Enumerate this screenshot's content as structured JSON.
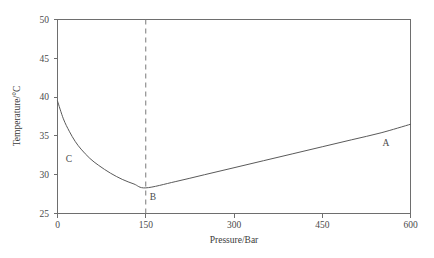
{
  "chart_data": {
    "type": "line",
    "title": "",
    "xlabel": "Pressure/Bar",
    "ylabel": "Temperature/°C",
    "xlim": [
      0,
      600
    ],
    "ylim": [
      25,
      50
    ],
    "xticks": [
      0,
      150,
      300,
      450,
      600
    ],
    "xtick_labels": [
      "0",
      "150",
      "300",
      "450",
      "600"
    ],
    "yticks": [
      25,
      30,
      35,
      40,
      45,
      50
    ],
    "ytick_labels": [
      "25",
      "30",
      "35",
      "40",
      "45",
      "50"
    ],
    "grid": false,
    "legend": "none",
    "series": [
      {
        "name": "inversion curve",
        "x": [
          0,
          10,
          20,
          30,
          40,
          55,
          70,
          90,
          110,
          130,
          150,
          200,
          250,
          300,
          350,
          400,
          450,
          500,
          550,
          600
        ],
        "y": [
          39.5,
          37.2,
          35.6,
          34.3,
          33.3,
          32.1,
          31.2,
          30.2,
          29.4,
          28.8,
          28.3,
          29.1,
          30.0,
          30.9,
          31.8,
          32.7,
          33.6,
          34.5,
          35.4,
          36.5
        ]
      }
    ],
    "annotations": [
      {
        "label": "A",
        "x": 570,
        "y": 31.8
      },
      {
        "label": "B",
        "x": 163,
        "y": 26.8
      },
      {
        "label": "C",
        "x": 28,
        "y": 31.4
      }
    ],
    "reference_lines": [
      {
        "orientation": "vertical",
        "x": 150,
        "style": "dashed",
        "from_y": 25,
        "to_y": 50
      }
    ],
    "colors": {
      "background": "#ffffff",
      "axis": "#6e6e6e",
      "curve": "#5a5a5a",
      "dashed": "#7a7a7a",
      "text": "#3a3a3a"
    }
  }
}
